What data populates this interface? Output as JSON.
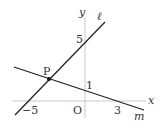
{
  "diagram": {
    "axes": {
      "x_label": "x",
      "y_label": "y",
      "origin_label": "O",
      "color": "#c8c8c8"
    },
    "ticks": {
      "x_neg5": "−5",
      "x_3": "3",
      "y_5": "5",
      "y_1": "1"
    },
    "lines": {
      "l": {
        "label": "ℓ",
        "color": "#222222"
      },
      "m": {
        "label": "m",
        "color": "#222222"
      }
    },
    "point": {
      "label": "P",
      "color": "#111111"
    }
  }
}
